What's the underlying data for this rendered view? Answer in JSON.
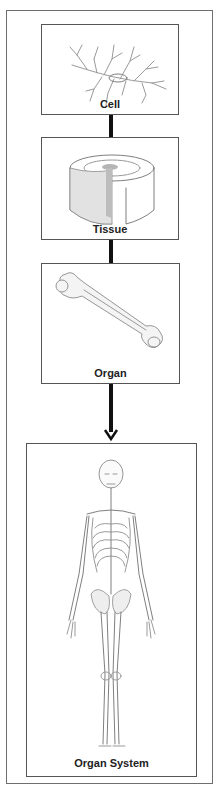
{
  "diagram": {
    "type": "hierarchy-flow",
    "direction": "top-to-bottom",
    "levels": [
      {
        "label": "Cell",
        "illustration": "branching-cell-icon"
      },
      {
        "label": "Tissue",
        "illustration": "tissue-cross-section-icon"
      },
      {
        "label": "Organ",
        "illustration": "femur-bone-icon"
      },
      {
        "label": "Organ System",
        "illustration": "skeleton-icon"
      }
    ],
    "connectors": [
      {
        "from": "Cell",
        "to": "Tissue",
        "style": "thick-line"
      },
      {
        "from": "Tissue",
        "to": "Organ",
        "style": "thick-line"
      },
      {
        "from": "Organ",
        "to": "Organ System",
        "style": "arrow"
      }
    ],
    "colors": {
      "border": "#555555",
      "connector": "#111111",
      "label": "#222222",
      "illustration": "#9a9a9a"
    }
  }
}
